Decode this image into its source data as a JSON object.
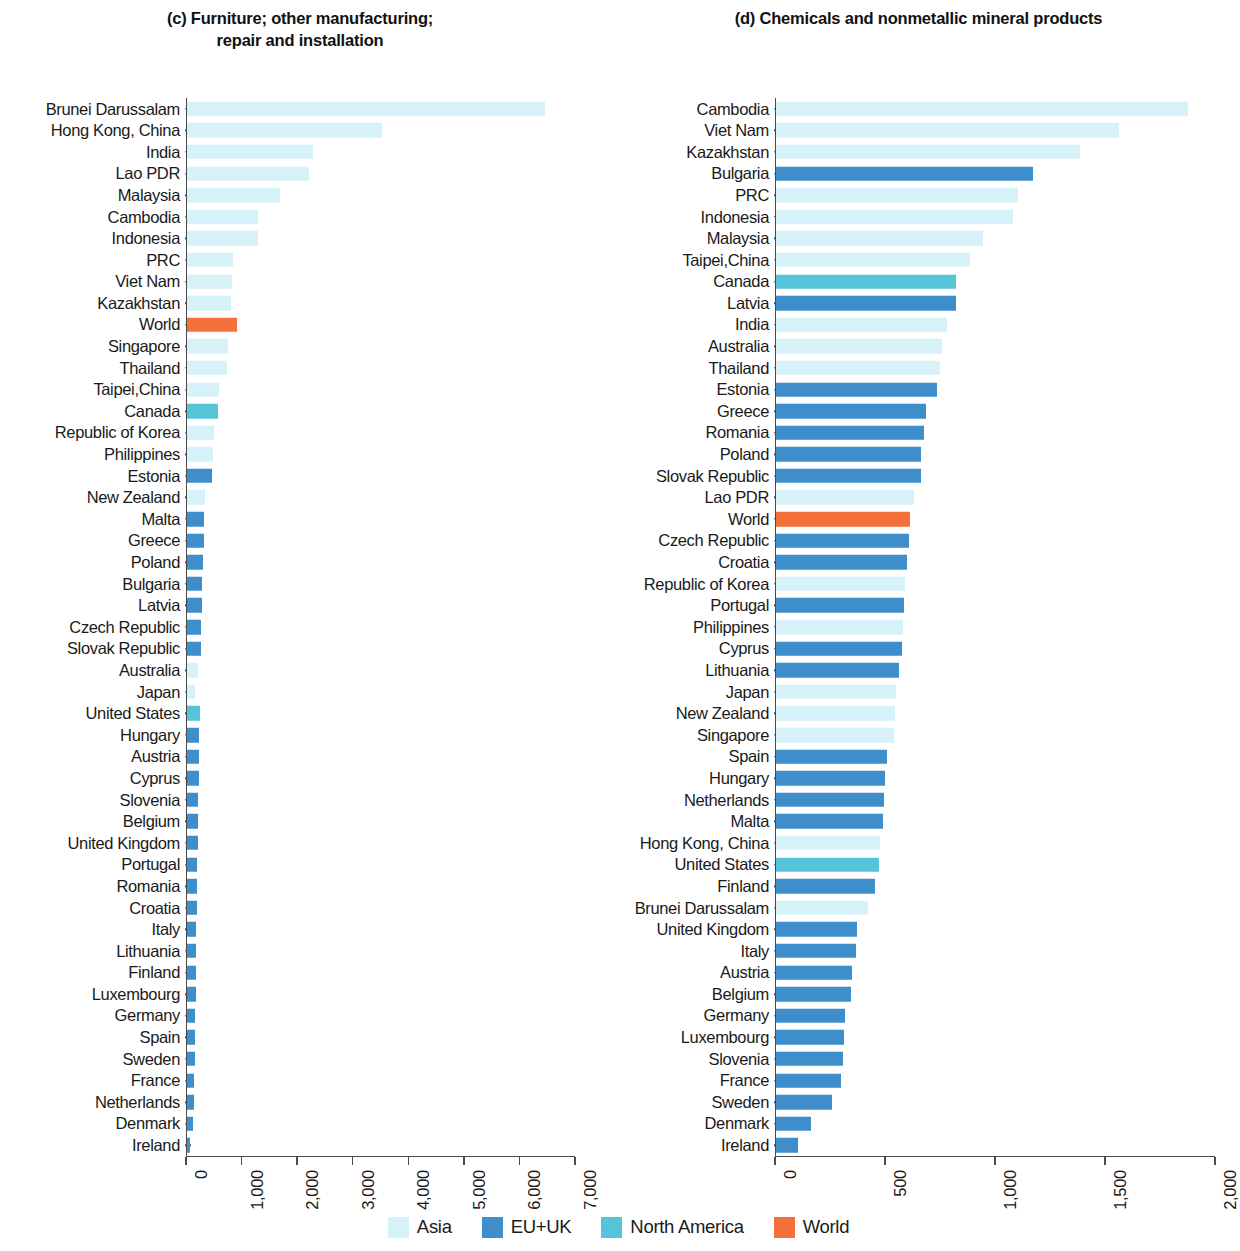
{
  "colors": {
    "asia": "#d6f2f8",
    "eu_uk": "#3e8ecc",
    "north_america": "#55c4d8",
    "world": "#f4703a",
    "axis": "#4a4a4a",
    "text": "#1a1a1a"
  },
  "legend": {
    "items": [
      {
        "label": "Asia",
        "color_key": "asia"
      },
      {
        "label": "EU+UK",
        "color_key": "eu_uk"
      },
      {
        "label": "North America",
        "color_key": "north_america"
      },
      {
        "label": "World",
        "color_key": "world"
      }
    ]
  },
  "panel_c": {
    "title": "(c) Furniture; other manufacturing;\nrepair and installation"
  },
  "panel_d": {
    "title": "(d) Chemicals and nonmetallic mineral products"
  },
  "chart_data": [
    {
      "type": "bar",
      "orientation": "horizontal",
      "panel": "c",
      "title": "(c) Furniture; other manufacturing; repair and installation",
      "xlabel": "",
      "ylabel": "",
      "xlim": [
        0,
        7000
      ],
      "xticks": [
        0,
        1000,
        2000,
        3000,
        4000,
        5000,
        6000,
        7000
      ],
      "xtick_labels": [
        "0",
        "1,000",
        "2,000",
        "3,000",
        "4,000",
        "5,000",
        "6,000",
        "7,000"
      ],
      "grid": false,
      "legend_position": "bottom",
      "categories": [
        "Brunei Darussalam",
        "Hong Kong, China",
        "India",
        "Lao PDR",
        "Malaysia",
        "Cambodia",
        "Indonesia",
        "PRC",
        "Viet Nam",
        "Kazakhstan",
        "World",
        "Singapore",
        "Thailand",
        "Taipei,China",
        "Canada",
        "Republic of Korea",
        "Philippines",
        "Estonia",
        "New Zealand",
        "Malta",
        "Greece",
        "Poland",
        "Bulgaria",
        "Latvia",
        "Czech Republic",
        "Slovak Republic",
        "Australia",
        "Japan",
        "United States",
        "Hungary",
        "Austria",
        "Cyprus",
        "Slovenia",
        "Belgium",
        "United Kingdom",
        "Portugal",
        "Romania",
        "Croatia",
        "Italy",
        "Lithuania",
        "Finland",
        "Luxembourg",
        "Germany",
        "Spain",
        "Sweden",
        "France",
        "Netherlands",
        "Denmark",
        "Ireland"
      ],
      "values": [
        6060,
        3310,
        2140,
        2060,
        1570,
        1210,
        1200,
        780,
        760,
        740,
        845,
        690,
        680,
        540,
        520,
        450,
        440,
        420,
        300,
        290,
        280,
        270,
        260,
        250,
        240,
        235,
        180,
        130,
        220,
        210,
        200,
        195,
        190,
        185,
        180,
        175,
        170,
        165,
        160,
        155,
        150,
        145,
        140,
        135,
        130,
        120,
        115,
        95,
        55
      ],
      "groups": [
        "asia",
        "asia",
        "asia",
        "asia",
        "asia",
        "asia",
        "asia",
        "asia",
        "asia",
        "asia",
        "world",
        "asia",
        "asia",
        "asia",
        "north_america",
        "asia",
        "asia",
        "eu_uk",
        "asia",
        "eu_uk",
        "eu_uk",
        "eu_uk",
        "eu_uk",
        "eu_uk",
        "eu_uk",
        "eu_uk",
        "asia",
        "asia",
        "north_america",
        "eu_uk",
        "eu_uk",
        "eu_uk",
        "eu_uk",
        "eu_uk",
        "eu_uk",
        "eu_uk",
        "eu_uk",
        "eu_uk",
        "eu_uk",
        "eu_uk",
        "eu_uk",
        "eu_uk",
        "eu_uk",
        "eu_uk",
        "eu_uk",
        "eu_uk",
        "eu_uk",
        "eu_uk",
        "eu_uk"
      ]
    },
    {
      "type": "bar",
      "orientation": "horizontal",
      "panel": "d",
      "title": "(d) Chemicals and nonmetallic mineral products",
      "xlabel": "",
      "ylabel": "",
      "xlim": [
        0,
        2000
      ],
      "xticks": [
        0,
        500,
        1000,
        1500,
        2000
      ],
      "xtick_labels": [
        "0",
        "500",
        "1,000",
        "1,500",
        "2,000"
      ],
      "grid": false,
      "legend_position": "bottom",
      "categories": [
        "Cambodia",
        "Viet Nam",
        "Kazakhstan",
        "Bulgaria",
        "PRC",
        "Indonesia",
        "Malaysia",
        "Taipei,China",
        "Canada",
        "Latvia",
        "India",
        "Australia",
        "Thailand",
        "Estonia",
        "Greece",
        "Romania",
        "Poland",
        "Slovak Republic",
        "Lao PDR",
        "World",
        "Czech Republic",
        "Croatia",
        "Republic of Korea",
        "Portugal",
        "Philippines",
        "Cyprus",
        "Lithuania",
        "Japan",
        "New Zealand",
        "Singapore",
        "Spain",
        "Hungary",
        "Netherlands",
        "Malta",
        "Hong Kong, China",
        "United States",
        "Finland",
        "Brunei Darussalam",
        "United Kingdom",
        "Italy",
        "Austria",
        "Belgium",
        "Germany",
        "Luxembourg",
        "Slovenia",
        "France",
        "Sweden",
        "Denmark",
        "Ireland"
      ],
      "values": [
        1786,
        1486,
        1318,
        1114,
        1050,
        1030,
        900,
        840,
        780,
        780,
        740,
        720,
        710,
        700,
        650,
        640,
        630,
        630,
        600,
        580,
        575,
        570,
        560,
        555,
        550,
        545,
        535,
        520,
        515,
        510,
        480,
        475,
        470,
        465,
        450,
        445,
        430,
        400,
        350,
        345,
        330,
        325,
        300,
        295,
        290,
        280,
        245,
        150,
        95
      ],
      "groups": [
        "asia",
        "asia",
        "asia",
        "eu_uk",
        "asia",
        "asia",
        "asia",
        "asia",
        "north_america",
        "eu_uk",
        "asia",
        "asia",
        "asia",
        "eu_uk",
        "eu_uk",
        "eu_uk",
        "eu_uk",
        "eu_uk",
        "asia",
        "world",
        "eu_uk",
        "eu_uk",
        "asia",
        "eu_uk",
        "asia",
        "eu_uk",
        "eu_uk",
        "asia",
        "asia",
        "asia",
        "eu_uk",
        "eu_uk",
        "eu_uk",
        "eu_uk",
        "asia",
        "north_america",
        "eu_uk",
        "asia",
        "eu_uk",
        "eu_uk",
        "eu_uk",
        "eu_uk",
        "eu_uk",
        "eu_uk",
        "eu_uk",
        "eu_uk",
        "eu_uk",
        "eu_uk",
        "eu_uk"
      ]
    }
  ]
}
